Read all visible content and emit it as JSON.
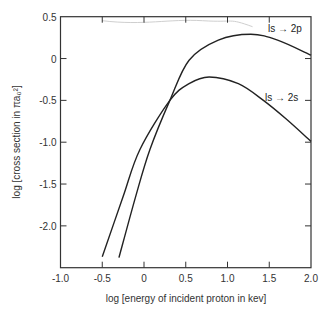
{
  "chart_data": {
    "type": "line",
    "title": "",
    "xlabel": "log [energy of incident proton in kev]",
    "ylabel": "log [cross section in πa₀²]",
    "xlim": [
      -1.0,
      2.0
    ],
    "ylim": [
      -2.5,
      0.5
    ],
    "xticks": [
      -1.0,
      -0.5,
      0,
      0.5,
      1.0,
      1.5,
      2.0
    ],
    "xtick_labels": [
      "-1.0",
      "-0.5",
      "0",
      "0.5",
      "1.0",
      "1.5",
      "2.0"
    ],
    "yticks": [
      0.5,
      0,
      -0.5,
      -1.0,
      -1.5,
      -2.0
    ],
    "ytick_labels": [
      "0.5",
      "0",
      "-0.5",
      "-1.0",
      "-1.5",
      "-2.0"
    ],
    "grid": false,
    "legend": "inline labels",
    "series": [
      {
        "name": "1s → 2p",
        "label": "ls → 2p",
        "x": [
          -0.3,
          -0.1,
          0.07,
          0.31,
          0.54,
          0.89,
          1.28,
          1.6,
          2.0
        ],
        "y": [
          -2.38,
          -1.65,
          -1.09,
          -0.5,
          -0.02,
          0.22,
          0.29,
          0.22,
          0.04
        ]
      },
      {
        "name": "1s → 2s",
        "label": "ls → 2s",
        "x": [
          -0.5,
          -0.25,
          -0.05,
          0.31,
          0.54,
          0.78,
          1.13,
          1.43,
          1.7,
          2.0
        ],
        "y": [
          -2.37,
          -1.65,
          -1.09,
          -0.5,
          -0.3,
          -0.22,
          -0.3,
          -0.5,
          -0.72,
          -0.99
        ]
      }
    ]
  },
  "labels": {
    "series_2p": "ls → 2p",
    "series_2s": "ls → 2s",
    "xaxis": "log [energy of incident proton in kev]",
    "yaxis_prefix": "log",
    "yaxis_inner": "cross section in πa₀²"
  },
  "colors": {
    "line": "#222222",
    "frame": "#333333",
    "bleed": "#cfcfcf"
  }
}
